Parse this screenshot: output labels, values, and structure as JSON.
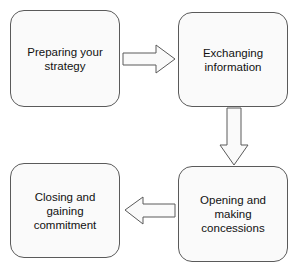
{
  "diagram": {
    "type": "process-flow",
    "steps": [
      {
        "id": 1,
        "label": "Preparing your strategy",
        "lines": [
          "Preparing your",
          "strategy"
        ]
      },
      {
        "id": 2,
        "label": "Exchanging information",
        "lines": [
          "Exchanging",
          "information"
        ]
      },
      {
        "id": 3,
        "label": "Opening and making concessions",
        "lines": [
          "Opening and",
          "making",
          "concessions"
        ]
      },
      {
        "id": 4,
        "label": "Closing and gaining commitment",
        "lines": [
          "Closing and",
          "gaining",
          "commitment"
        ]
      }
    ],
    "arrows": [
      {
        "from": 1,
        "to": 2,
        "direction": "right"
      },
      {
        "from": 2,
        "to": 3,
        "direction": "down"
      },
      {
        "from": 3,
        "to": 4,
        "direction": "left"
      }
    ],
    "colors": {
      "stroke": "#5a5a5a",
      "fill": "#fafafa",
      "text": "#111111"
    }
  }
}
